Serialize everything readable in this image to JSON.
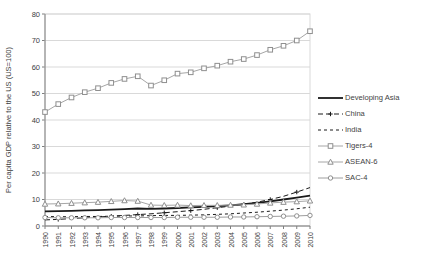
{
  "colors": {
    "background": "#ffffff",
    "gridline": "#d9d9d9",
    "axis": "#7f7f7f",
    "tick_text": "#404040",
    "black_series": "#1a1a1a",
    "gray_series": "#a6a6a6",
    "gray_marker": "#8f8f8f"
  },
  "chart_data": {
    "type": "line",
    "title": "",
    "ylabel": "Per capita GDP relative to the US (US=100)",
    "xlabel": "",
    "ylim": [
      0,
      80
    ],
    "ytick_step": 10,
    "yticks": [
      0,
      10,
      20,
      30,
      40,
      50,
      60,
      70,
      80
    ],
    "grid": "horizontal",
    "legend_position": "right",
    "categories": [
      1990,
      1991,
      1992,
      1993,
      1994,
      1995,
      1996,
      1997,
      1998,
      1999,
      2000,
      2001,
      2002,
      2003,
      2004,
      2005,
      2006,
      2007,
      2008,
      2009,
      2010
    ],
    "series": [
      {
        "name": "Developing Asia",
        "values": [
          5.5,
          5.6,
          5.7,
          5.9,
          6.0,
          6.2,
          6.4,
          6.6,
          6.5,
          6.6,
          6.8,
          7.0,
          7.2,
          7.5,
          7.8,
          8.2,
          8.7,
          9.3,
          10.0,
          10.7,
          11.5
        ],
        "color": "#1a1a1a",
        "width": 1.8,
        "dash": "",
        "marker": "none"
      },
      {
        "name": "China",
        "values": [
          2.3,
          2.5,
          2.8,
          3.1,
          3.4,
          3.7,
          4.0,
          4.3,
          4.6,
          5.0,
          5.4,
          5.8,
          6.3,
          6.9,
          7.5,
          8.2,
          9.0,
          10.0,
          11.2,
          12.8,
          14.5
        ],
        "color": "#1a1a1a",
        "width": 1,
        "dash": "5,3",
        "marker": "plus"
      },
      {
        "name": "India",
        "values": [
          3.6,
          3.5,
          3.5,
          3.6,
          3.6,
          3.7,
          3.8,
          3.8,
          3.9,
          4.0,
          4.0,
          4.1,
          4.2,
          4.4,
          4.6,
          4.9,
          5.2,
          5.6,
          6.0,
          6.5,
          7.1
        ],
        "color": "#1a1a1a",
        "width": 1,
        "dash": "3,3",
        "marker": "none"
      },
      {
        "name": "Tigers-4",
        "values": [
          43,
          46,
          48.5,
          50.5,
          52,
          54,
          55.5,
          56.5,
          53,
          55,
          57.5,
          58,
          59.5,
          60.5,
          62,
          63,
          64.5,
          66.5,
          68,
          70,
          73.5
        ],
        "color": "#a6a6a6",
        "width": 1,
        "dash": "",
        "marker": "square"
      },
      {
        "name": "ASEAN-6",
        "values": [
          8.3,
          8.4,
          8.6,
          8.8,
          9.0,
          9.3,
          9.6,
          9.4,
          7.9,
          7.8,
          7.9,
          7.7,
          7.8,
          7.8,
          7.9,
          8.0,
          8.3,
          8.7,
          9.0,
          9.2,
          9.5
        ],
        "color": "#a6a6a6",
        "width": 1,
        "dash": "",
        "marker": "triangle"
      },
      {
        "name": "SAC-4",
        "values": [
          3.2,
          3.1,
          3.1,
          3.1,
          3.1,
          3.2,
          3.2,
          3.2,
          3.2,
          3.2,
          3.3,
          3.3,
          3.3,
          3.3,
          3.4,
          3.4,
          3.5,
          3.6,
          3.7,
          3.8,
          4.0
        ],
        "color": "#9e9e9e",
        "width": 1,
        "dash": "",
        "marker": "circle"
      }
    ]
  },
  "legend": {
    "items": [
      "Developing Asia",
      "China",
      "India",
      "Tigers-4",
      "ASEAN-6",
      "SAC-4"
    ]
  }
}
